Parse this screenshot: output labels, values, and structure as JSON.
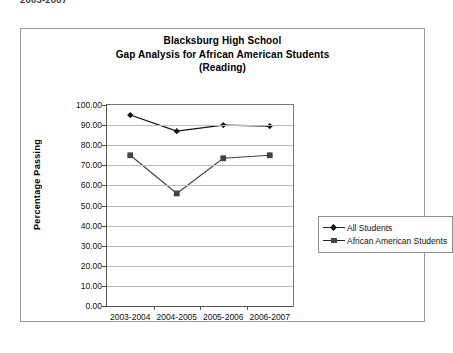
{
  "page": {
    "fragment_text": "2003-2007"
  },
  "chart": {
    "title_lines": [
      "Blacksburg High School",
      "Gap Analysis for African American Students",
      "(Reading)"
    ],
    "y_axis_title": "Percentage Passing",
    "legend": {
      "items": [
        {
          "label": "All Students",
          "marker": "diamond"
        },
        {
          "label": "African American Students",
          "marker": "square"
        }
      ]
    }
  },
  "chart_data": {
    "type": "line",
    "title": "Blacksburg High School Gap Analysis for African American Students (Reading)",
    "xlabel": "",
    "ylabel": "Percentage Passing",
    "categories": [
      "2003-2004",
      "2004-2005",
      "2005-2006",
      "2006-2007"
    ],
    "series": [
      {
        "name": "All Students",
        "marker": "diamond",
        "color": "#111111",
        "values": [
          95.0,
          87.0,
          90.0,
          89.5
        ]
      },
      {
        "name": "African American Students",
        "marker": "square",
        "color": "#444444",
        "values": [
          75.0,
          56.0,
          73.5,
          75.0
        ]
      }
    ],
    "ylim": [
      0,
      100
    ],
    "ytick_step": 10,
    "ytick_labels": [
      "0.00",
      "10.00",
      "20.00",
      "30.00",
      "40.00",
      "50.00",
      "60.00",
      "70.00",
      "80.00",
      "90.00",
      "100.00"
    ],
    "grid": true,
    "legend_position": "right"
  }
}
